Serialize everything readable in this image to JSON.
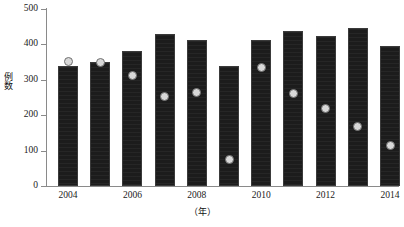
{
  "chart_data": {
    "type": "bar",
    "title": "",
    "xlabel": "（年）",
    "ylabel": "例数",
    "categories": [
      "2004",
      "2005",
      "2006",
      "2007",
      "2008",
      "2009",
      "2010",
      "2011",
      "2012",
      "2013",
      "2014"
    ],
    "x_tick_labels": [
      "2004",
      "2006",
      "2008",
      "2010",
      "2012",
      "2014"
    ],
    "y_tick_labels": [
      "0",
      "100",
      "200",
      "300",
      "400",
      "500"
    ],
    "y_ticks": [
      0,
      100,
      200,
      300,
      400,
      500
    ],
    "ylim": [
      0,
      500
    ],
    "grid": false,
    "legend": false,
    "series": [
      {
        "name": "bars",
        "type": "bar",
        "color": "#1c1c1c",
        "values": [
          340,
          350,
          380,
          430,
          412,
          340,
          412,
          437,
          425,
          445,
          395
        ]
      },
      {
        "name": "points",
        "type": "scatter",
        "color": "#d8d8d8",
        "edge_color": "#6f6f6f",
        "values": [
          352,
          348,
          312,
          252,
          265,
          75,
          335,
          260,
          220,
          168,
          115
        ]
      }
    ]
  },
  "axes": {
    "y_axis_color": "#8a8a8a",
    "x_axis_color": "#8a8a8a"
  }
}
